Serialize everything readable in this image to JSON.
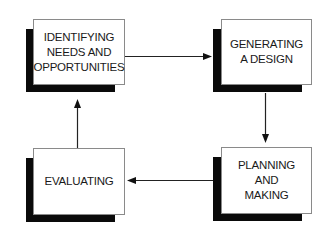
{
  "diagram": {
    "type": "cycle-flow",
    "stages": [
      {
        "id": "identify",
        "lines": [
          "IDENTIFYING",
          "NEEDS AND",
          "OPPORTUNITIES"
        ]
      },
      {
        "id": "generate",
        "lines": [
          "GENERATING",
          "A DESIGN"
        ]
      },
      {
        "id": "plan",
        "lines": [
          "PLANNING",
          "AND",
          "MAKING"
        ]
      },
      {
        "id": "evaluate",
        "lines": [
          "EVALUATING"
        ]
      }
    ],
    "connections": [
      {
        "from": "identify",
        "to": "generate",
        "direction": "right"
      },
      {
        "from": "generate",
        "to": "plan",
        "direction": "down"
      },
      {
        "from": "plan",
        "to": "evaluate",
        "direction": "left"
      },
      {
        "from": "evaluate",
        "to": "identify",
        "direction": "up"
      }
    ],
    "colors": {
      "shadow": "#0a0a0a",
      "box_border": "#8a8a8a",
      "text": "#1a1a1a",
      "arrow": "#222222"
    }
  }
}
